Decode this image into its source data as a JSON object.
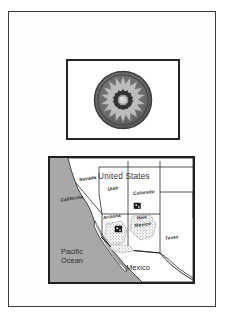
{
  "figure": {
    "background_color": "#ffffff",
    "border_color": "#3b3b3b"
  },
  "emblem_panel": {
    "name": "flag-emblem-panel",
    "border_color": "#242424",
    "background_color": "#ffffff",
    "emblem": {
      "name": "sunburst-rosette",
      "outer_disc_color": "#6e6e6e",
      "outer_ring_color": "#4a4a4a",
      "star_color": "#b9b9b9",
      "star_points": 18,
      "inner_ring_color": "#3a3a3a",
      "center_color": "#cfcfcf",
      "center_ring_color": "#8a8a8a"
    }
  },
  "map_panel": {
    "name": "locator-map",
    "border_color": "#1f1f1f",
    "land_color": "#ffffff",
    "water_color": "#a8a8a8",
    "boundary_color": "#1f1f1f",
    "stipple_color": "#6b6b6b",
    "marker_color": "#1a1a1a",
    "country_labels": [
      {
        "text": "United States",
        "style": "large"
      },
      {
        "text": "Mexico",
        "style": "large"
      }
    ],
    "water_labels": [
      {
        "line1": "Pacific",
        "line2": "Ocean"
      }
    ],
    "state_labels": [
      {
        "text": "Nevada"
      },
      {
        "text": "Utah"
      },
      {
        "text": "Colorado"
      },
      {
        "text": "California"
      },
      {
        "text": "Arizona"
      },
      {
        "text": "New"
      },
      {
        "text": "Mexico"
      },
      {
        "text": "Texas"
      }
    ],
    "site_markers": [
      {
        "name": "site-marker-new-mexico"
      },
      {
        "name": "site-marker-arizona"
      }
    ]
  }
}
